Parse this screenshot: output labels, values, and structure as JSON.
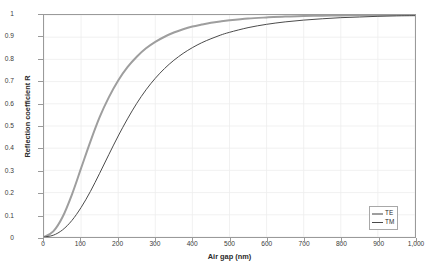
{
  "chart_data": {
    "type": "line",
    "title": "",
    "xlabel": "Air gap (nm)",
    "ylabel": "Reflection coefficient R",
    "xlim": [
      0,
      1000
    ],
    "ylim": [
      0,
      1
    ],
    "grid": true,
    "legend_position": "lower right",
    "xticks": [
      0,
      100,
      200,
      300,
      400,
      500,
      600,
      700,
      800,
      900,
      1000
    ],
    "xticklabels": [
      "0",
      "100",
      "200",
      "300",
      "400",
      "500",
      "600",
      "700",
      "800",
      "900",
      "1,000"
    ],
    "yticks": [
      0,
      0.1,
      0.2,
      0.3,
      0.4,
      0.5,
      0.6,
      0.7,
      0.8,
      0.9,
      1
    ],
    "yticklabels": [
      "0",
      "0.1",
      "0.2",
      "0.3",
      "0.4",
      "0.5",
      "0.6",
      "0.7",
      "0.8",
      "0.9",
      "1"
    ],
    "x": [
      0,
      25,
      50,
      75,
      100,
      125,
      150,
      175,
      200,
      225,
      250,
      275,
      300,
      325,
      350,
      375,
      400,
      425,
      450,
      475,
      500,
      550,
      600,
      650,
      700,
      750,
      800,
      850,
      900,
      950,
      1000
    ],
    "series": [
      {
        "name": "TE",
        "color": "#9e9e9e",
        "width": 2.0,
        "values": [
          0.0,
          0.025,
          0.09,
          0.19,
          0.31,
          0.43,
          0.54,
          0.63,
          0.705,
          0.765,
          0.812,
          0.85,
          0.879,
          0.902,
          0.921,
          0.936,
          0.948,
          0.957,
          0.965,
          0.971,
          0.976,
          0.984,
          0.989,
          0.993,
          0.995,
          0.997,
          0.998,
          0.999,
          0.999,
          1.0,
          1.0
        ]
      },
      {
        "name": "TM",
        "color": "#4a4a4a",
        "width": 1.0,
        "values": [
          0.0,
          0.008,
          0.032,
          0.074,
          0.133,
          0.205,
          0.287,
          0.372,
          0.455,
          0.532,
          0.602,
          0.663,
          0.715,
          0.759,
          0.796,
          0.827,
          0.853,
          0.875,
          0.893,
          0.909,
          0.922,
          0.943,
          0.958,
          0.969,
          0.977,
          0.983,
          0.988,
          0.991,
          0.994,
          0.996,
          0.997
        ]
      }
    ]
  }
}
